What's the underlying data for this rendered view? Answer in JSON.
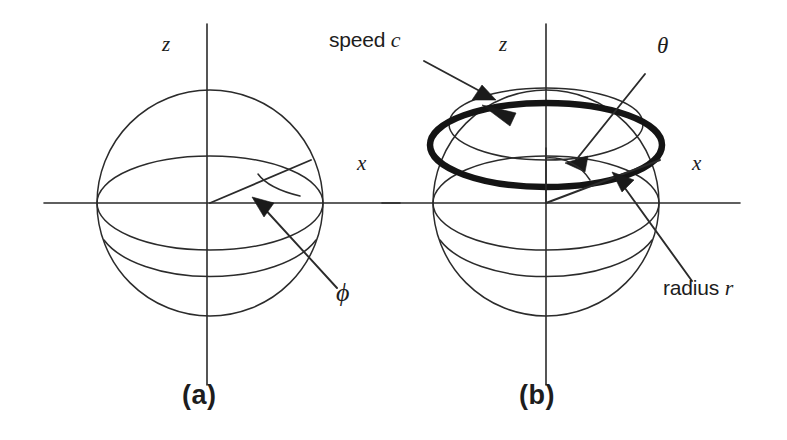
{
  "figure": {
    "caption_a": "(a)",
    "caption_b": "(b)",
    "ink_color": "#1d1d1d",
    "background_color": "#ffffff"
  },
  "panel_a": {
    "id": "(a)",
    "axis_z_label": "z",
    "axis_x_label": "x",
    "angle_label": "ϕ",
    "description": "sphere with equatorial great circle, radial line in the equatorial plane and an arc marking the azimuthal angle phi measured from the x axis"
  },
  "panel_b": {
    "id": "(b)",
    "axis_z_label": "z",
    "axis_x_label": "x",
    "angle_label": "θ",
    "speed_label_text": "speed ",
    "speed_label_symbol": "c",
    "radius_label_text": "radius ",
    "radius_label_symbol": "r",
    "description": "sphere with a bold circle of latitude traversed at speed c, polar angle theta measured from the z axis and the radius r of the latitude circle"
  },
  "geometry": {
    "sphere_radius_px": 113,
    "panel_a_center": {
      "x": 210,
      "y": 203
    },
    "panel_b_center": {
      "x": 546,
      "y": 203
    },
    "bold_ring_rx": 140,
    "bold_ring_ry": 40
  }
}
